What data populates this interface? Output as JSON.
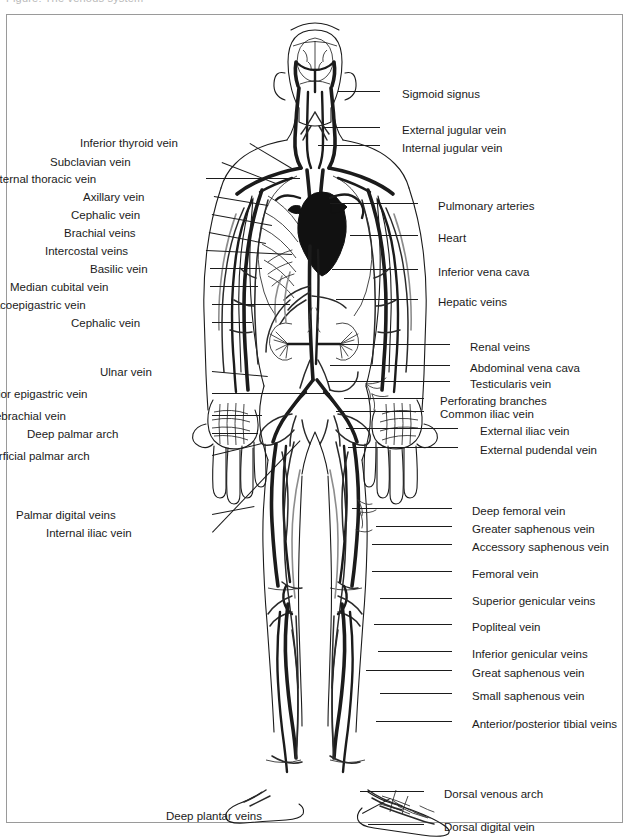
{
  "page": {
    "top_cut_text": "Figure: The venous system",
    "background_color": "#ffffff",
    "frame_color": "#9a9a9a",
    "ink_color": "#1b1b1b",
    "width": 631,
    "height": 837
  },
  "diagram": {
    "organs": [
      {
        "name": "brain",
        "fill": "outline"
      },
      {
        "name": "heart",
        "fill": "solid-black"
      },
      {
        "name": "kidneys",
        "fill": "outline"
      },
      {
        "name": "ribcage",
        "fill": "outline"
      }
    ]
  },
  "labels_left": [
    {
      "text": "Inferior thyroid vein",
      "x": 178,
      "y": 137,
      "lx1": 250,
      "ly1": 143,
      "lx2": 292,
      "ly2": 168
    },
    {
      "text": "Subclavian vein",
      "x": 131,
      "y": 156,
      "lx1": 222,
      "ly1": 162,
      "lx2": 276,
      "ly2": 183
    },
    {
      "text": "Internal thoracic vein",
      "x": 96,
      "y": 173,
      "lx1": 206,
      "ly1": 178,
      "lx2": 300,
      "ly2": 178
    },
    {
      "text": "Axillary vein",
      "x": 144,
      "y": 191,
      "lx1": 214,
      "ly1": 196,
      "lx2": 268,
      "ly2": 205
    },
    {
      "text": "Cephalic vein",
      "x": 140,
      "y": 209,
      "lx1": 212,
      "ly1": 214,
      "lx2": 272,
      "ly2": 225
    },
    {
      "text": "Brachial veins",
      "x": 136,
      "y": 227,
      "lx1": 209,
      "ly1": 232,
      "lx2": 266,
      "ly2": 243
    },
    {
      "text": "Intercostal veins",
      "x": 128,
      "y": 245,
      "lx1": 206,
      "ly1": 250,
      "lx2": 292,
      "ly2": 254
    },
    {
      "text": "Basilic vein",
      "x": 148,
      "y": 263,
      "lx1": 210,
      "ly1": 268,
      "lx2": 262,
      "ly2": 268
    },
    {
      "text": "Median cubital vein",
      "x": 108,
      "y": 281,
      "lx1": 210,
      "ly1": 286,
      "lx2": 258,
      "ly2": 286
    },
    {
      "text": "Thoracoepigastric vein",
      "x": 86,
      "y": 299,
      "lx1": 212,
      "ly1": 304,
      "lx2": 290,
      "ly2": 304
    },
    {
      "text": "Cephalic vein",
      "x": 140,
      "y": 317,
      "lx1": 212,
      "ly1": 322,
      "lx2": 252,
      "ly2": 322
    },
    {
      "text": "Ulnar vein",
      "x": 152,
      "y": 366,
      "lx1": 212,
      "ly1": 371,
      "lx2": 268,
      "ly2": 376
    },
    {
      "text": "Inferior epigastric vein",
      "x": 88,
      "y": 388,
      "lx1": 212,
      "ly1": 393,
      "lx2": 330,
      "ly2": 393
    },
    {
      "text": "Median antebrachial vein",
      "x": 66,
      "y": 410,
      "lx1": 212,
      "ly1": 415,
      "lx2": 262,
      "ly2": 415
    },
    {
      "text": "Deep palmar arch",
      "x": 118,
      "y": 428,
      "lx1": 212,
      "ly1": 433,
      "lx2": 258,
      "ly2": 433
    },
    {
      "text": "Superficial palmar arch",
      "x": 90,
      "y": 450,
      "lx1": 212,
      "ly1": 455,
      "lx2": 262,
      "ly2": 443
    },
    {
      "text": "Palmar digital veins",
      "x": 116,
      "y": 509,
      "lx1": 212,
      "ly1": 514,
      "lx2": 254,
      "ly2": 506
    },
    {
      "text": "Internal iliac vein",
      "x": 132,
      "y": 527,
      "lx1": 212,
      "ly1": 532,
      "lx2": 300,
      "ly2": 440
    },
    {
      "text": "Deep plantar veins",
      "x": 262,
      "y": 810,
      "lx1": 362,
      "ly1": 813,
      "lx2": 390,
      "ly2": 798
    }
  ],
  "labels_right": [
    {
      "text": "Sigmoid signus",
      "x": 402,
      "y": 88,
      "lx1": 380,
      "ly1": 92,
      "lx2": 338,
      "ly2": 92
    },
    {
      "text": "External jugular vein",
      "x": 402,
      "y": 124,
      "lx1": 380,
      "ly1": 128,
      "lx2": 322,
      "ly2": 128
    },
    {
      "text": "Internal jugular vein",
      "x": 402,
      "y": 142,
      "lx1": 380,
      "ly1": 146,
      "lx2": 318,
      "ly2": 146
    },
    {
      "text": "Pulmonary arteries",
      "x": 438,
      "y": 200,
      "lx1": 418,
      "ly1": 204,
      "lx2": 330,
      "ly2": 204
    },
    {
      "text": "Heart",
      "x": 438,
      "y": 232,
      "lx1": 418,
      "ly1": 236,
      "lx2": 350,
      "ly2": 236
    },
    {
      "text": "Inferior vena cava",
      "x": 438,
      "y": 266,
      "lx1": 418,
      "ly1": 270,
      "lx2": 332,
      "ly2": 270
    },
    {
      "text": "Hepatic veins",
      "x": 438,
      "y": 296,
      "lx1": 418,
      "ly1": 300,
      "lx2": 336,
      "ly2": 300
    },
    {
      "text": "Renal veins",
      "x": 470,
      "y": 341,
      "lx1": 450,
      "ly1": 345,
      "lx2": 330,
      "ly2": 345
    },
    {
      "text": "Abdominal vena cava",
      "x": 470,
      "y": 362,
      "lx1": 450,
      "ly1": 366,
      "lx2": 330,
      "ly2": 366
    },
    {
      "text": "Testicularis vein",
      "x": 470,
      "y": 378,
      "lx1": 450,
      "ly1": 382,
      "lx2": 328,
      "ly2": 382
    },
    {
      "text": "Perforating branches",
      "x": 440,
      "y": 395,
      "lx1": 424,
      "ly1": 399,
      "lx2": 344,
      "ly2": 399
    },
    {
      "text": "Common iliac vein",
      "x": 440,
      "y": 408,
      "lx1": 424,
      "ly1": 412,
      "lx2": 336,
      "ly2": 412
    },
    {
      "text": "External iliac vein",
      "x": 480,
      "y": 425,
      "lx1": 458,
      "ly1": 429,
      "lx2": 346,
      "ly2": 429
    },
    {
      "text": "External pudendal vein",
      "x": 480,
      "y": 444,
      "lx1": 458,
      "ly1": 448,
      "lx2": 348,
      "ly2": 448
    },
    {
      "text": "Deep femoral vein",
      "x": 472,
      "y": 505,
      "lx1": 452,
      "ly1": 509,
      "lx2": 352,
      "ly2": 509
    },
    {
      "text": "Greater saphenous vein",
      "x": 472,
      "y": 523,
      "lx1": 452,
      "ly1": 527,
      "lx2": 376,
      "ly2": 527
    },
    {
      "text": "Accessory saphenous vein",
      "x": 472,
      "y": 541,
      "lx1": 452,
      "ly1": 545,
      "lx2": 372,
      "ly2": 545
    },
    {
      "text": "Femoral vein",
      "x": 472,
      "y": 568,
      "lx1": 452,
      "ly1": 572,
      "lx2": 372,
      "ly2": 572
    },
    {
      "text": "Superior genicular veins",
      "x": 472,
      "y": 595,
      "lx1": 452,
      "ly1": 599,
      "lx2": 380,
      "ly2": 599
    },
    {
      "text": "Popliteal vein",
      "x": 472,
      "y": 621,
      "lx1": 452,
      "ly1": 625,
      "lx2": 374,
      "ly2": 625
    },
    {
      "text": "Inferior genicular veins",
      "x": 472,
      "y": 648,
      "lx1": 452,
      "ly1": 652,
      "lx2": 378,
      "ly2": 652
    },
    {
      "text": "Great saphenous vein",
      "x": 472,
      "y": 667,
      "lx1": 452,
      "ly1": 671,
      "lx2": 366,
      "ly2": 671
    },
    {
      "text": "Small saphenous vein",
      "x": 472,
      "y": 690,
      "lx1": 452,
      "ly1": 694,
      "lx2": 380,
      "ly2": 694
    },
    {
      "text": "Anterior/posterior tibial veins",
      "x": 472,
      "y": 718,
      "lx1": 452,
      "ly1": 722,
      "lx2": 376,
      "ly2": 722
    },
    {
      "text": "Dorsal venous arch",
      "x": 444,
      "y": 788,
      "lx1": 424,
      "ly1": 792,
      "lx2": 360,
      "ly2": 792
    },
    {
      "text": "Dorsal digital vein",
      "x": 444,
      "y": 821,
      "lx1": 424,
      "ly1": 825,
      "lx2": 368,
      "ly2": 825
    }
  ]
}
